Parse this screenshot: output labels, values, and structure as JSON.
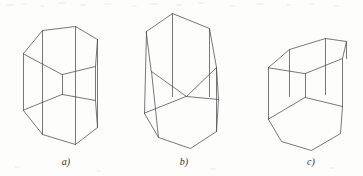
{
  "plate": {
    "width": 363,
    "height": 176,
    "background_color": "#fdfdfc",
    "stroke_color": "#4b4b50",
    "label_color": "#2e2e30",
    "caption_style": "italic-letter-paren"
  },
  "figures": [
    {
      "id": "figure-a",
      "label": "a)",
      "label_x": 51,
      "label_y": 156,
      "description": "hexagonal prism viewed from slightly above, upright",
      "top_face": "23.5,53.5 42.5,30.5 75.5,26.5 97.5,39.5 95.5,66.5 62.5,74.5",
      "bottom_face": "23.5,110.5 42.5,134.5 75.5,144.5 97.5,127.5 95.5,100.5 62.5,94.5",
      "vertical_edges": [
        "23.5,53.5 23.5,110.5",
        "42.5,30.5 42.5,134.5",
        "75.5,26.5 75.5,144.5",
        "97.5,39.5 97.5,127.5",
        "95.5,66.5 95.5,100.5",
        "62.5,74.5 62.5,94.5"
      ]
    },
    {
      "id": "figure-b",
      "label": "b)",
      "label_x": 169,
      "label_y": 156,
      "description": "hexagonal prism tilted, viewed from slightly below, leaning right",
      "top_face": "146.5,31.5 172.5,13.5 209.5,28.5 216.5,67.5 186.5,96.5 151.5,71.5",
      "bottom_face": "144.5,113.5 158.5,137.5 190.5,148.5 216.5,131.5 218.5,99.5 186.5,96.5",
      "vertical_edges": [
        "146.5,31.5 144.5,113.5",
        "172.5,13.5 172.5,96.5",
        "209.5,28.5 209.5,96.5",
        "216.5,67.5 216.5,131.5",
        "218.5,99.5 216.5,67.5",
        "151.5,71.5 158.5,137.5"
      ]
    },
    {
      "id": "figure-c",
      "label": "c)",
      "label_x": 296,
      "label_y": 156,
      "description": "hexagonal prism viewed nearly edge-on from above, flattened top face",
      "top_face": "268.5,67.5 289.5,49.5 325.5,38.5 346.5,41.5 342.5,58.5 305.5,73.5",
      "bottom_face": "268.5,119.5 281.5,141.5 311.5,150.5 340.5,133.5 342.5,106.5 305.5,97.5",
      "vertical_edges": [
        "268.5,67.5 268.5,119.5",
        "289.5,49.5 289.5,96.5",
        "325.5,38.5 325.5,94.5",
        "346.5,41.5 346.5,58.5",
        "342.5,58.5 342.5,106.5",
        "305.5,73.5 305.5,97.5"
      ]
    }
  ]
}
